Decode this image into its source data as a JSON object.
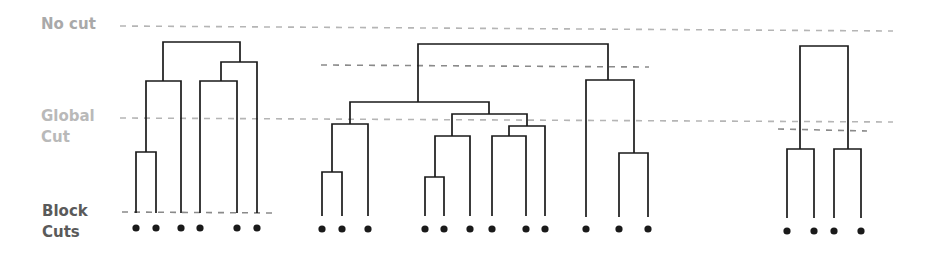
{
  "labels": {
    "no_cut": "No cut",
    "global_cut_line1": "Global",
    "global_cut_line2": "Cut",
    "block_cuts_line1": "Block",
    "block_cuts_line2": "Cuts"
  },
  "colors": {
    "tree": "#1a1a1a",
    "dash_light": "#b0b0b0",
    "dash_dark": "#8a8a8a",
    "no_cut_label": "#a9a9a9",
    "global_label": "#b9b9b9",
    "block_label": "#5a5a5a"
  },
  "cut_lines": [
    {
      "name": "no-cut-line",
      "x1": 120,
      "x2": 893,
      "y1": 26,
      "y2": 31,
      "color": "#b5b5b5"
    },
    {
      "name": "global-cut-line",
      "x1": 120,
      "x2": 893,
      "y1": 118,
      "y2": 122,
      "color": "#b5b5b5"
    },
    {
      "name": "block-cut-dendrogram-1",
      "x1": 122,
      "x2": 276,
      "y1": 212,
      "y2": 213,
      "color": "#8a8a8a"
    },
    {
      "name": "block-cut-dendrogram-2",
      "x1": 321,
      "x2": 649,
      "y1": 65,
      "y2": 67,
      "color": "#8a8a8a"
    },
    {
      "name": "block-cut-dendrogram-3",
      "x1": 778,
      "x2": 867,
      "y1": 129,
      "y2": 131,
      "color": "#8a8a8a"
    }
  ],
  "dendrograms": [
    {
      "name": "dendrogram-1",
      "leaves": [
        136,
        156,
        181,
        200,
        237,
        257
      ],
      "leaf_y": 228,
      "stem_bottom": 213,
      "merges": [
        {
          "l": 136,
          "r": 156,
          "y": 152,
          "ly": 213,
          "ry": 213
        },
        {
          "l": 146,
          "r": 181,
          "y": 81,
          "ly": 152,
          "ry": 213
        },
        {
          "l": 200,
          "r": 237,
          "y": 81,
          "ly": 213,
          "ry": 213
        },
        {
          "l": 221,
          "r": 257,
          "y": 62,
          "ly": 81,
          "ry": 213
        },
        {
          "l": 163,
          "r": 240,
          "y": 42,
          "ly": 81,
          "ry": 62
        }
      ]
    },
    {
      "name": "dendrogram-2",
      "leaves": [
        322,
        342,
        368,
        425,
        444,
        470,
        492,
        526,
        545,
        586,
        619,
        648
      ],
      "leaf_y": 229,
      "stem_bottom": 216,
      "merges": [
        {
          "l": 322,
          "r": 342,
          "y": 172,
          "ly": 216,
          "ry": 216
        },
        {
          "l": 332,
          "r": 368,
          "y": 124,
          "ly": 172,
          "ry": 216
        },
        {
          "l": 425,
          "r": 444,
          "y": 177,
          "ly": 216,
          "ry": 216
        },
        {
          "l": 435,
          "r": 470,
          "y": 136,
          "ly": 177,
          "ry": 216
        },
        {
          "l": 492,
          "r": 526,
          "y": 136,
          "ly": 216,
          "ry": 216
        },
        {
          "l": 509,
          "r": 545,
          "y": 126,
          "ly": 136,
          "ry": 216
        },
        {
          "l": 452,
          "r": 527,
          "y": 114,
          "ly": 136,
          "ry": 126
        },
        {
          "l": 350,
          "r": 489,
          "y": 102,
          "ly": 124,
          "ry": 114
        },
        {
          "l": 619,
          "r": 648,
          "y": 153,
          "ly": 217,
          "ry": 217
        },
        {
          "l": 586,
          "r": 634,
          "y": 80,
          "ly": 217,
          "ry": 153
        },
        {
          "l": 418,
          "r": 608,
          "y": 44,
          "ly": 102,
          "ry": 80
        }
      ]
    },
    {
      "name": "dendrogram-3",
      "leaves": [
        787,
        814,
        834,
        861
      ],
      "leaf_y": 231,
      "stem_bottom": 218,
      "merges": [
        {
          "l": 787,
          "r": 814,
          "y": 149,
          "ly": 218,
          "ry": 218
        },
        {
          "l": 834,
          "r": 861,
          "y": 149,
          "ly": 218,
          "ry": 218
        },
        {
          "l": 800,
          "r": 848,
          "y": 46,
          "ly": 149,
          "ry": 149
        }
      ]
    }
  ]
}
